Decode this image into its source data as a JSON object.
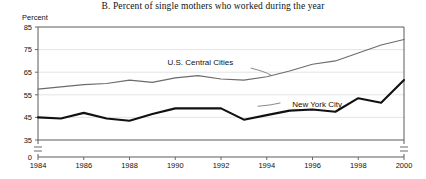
{
  "figure": {
    "title": "B. Percent of single mothers who worked during the year",
    "y_axis_label": "Percent"
  },
  "chart_data": {
    "type": "line",
    "title": "B. Percent of single mothers who worked during the year",
    "xlabel": "",
    "ylabel": "Percent",
    "x": [
      1984,
      1985,
      1986,
      1987,
      1988,
      1989,
      1990,
      1991,
      1992,
      1993,
      1994,
      1995,
      1996,
      1997,
      1998,
      1999,
      2000
    ],
    "xlim": [
      1984,
      2000
    ],
    "ylim": [
      35,
      85
    ],
    "y_break_to_zero": true,
    "x_tick_labels": [
      "1984",
      "1986",
      "1988",
      "1990",
      "1992",
      "1994",
      "1996",
      "1998",
      "2000"
    ],
    "y_tick_labels": [
      "0",
      "35",
      "45",
      "55",
      "65",
      "75",
      "85"
    ],
    "grid": "horizontal",
    "legend": "inline-annotations",
    "series": [
      {
        "name": "U.S. Central Cities",
        "color": "#6b6b6b",
        "style": "thin",
        "label_x": 1991.1,
        "label_y": 68.0,
        "values": [
          57.5,
          58.5,
          59.5,
          60.0,
          61.5,
          60.5,
          62.5,
          63.5,
          62.0,
          61.5,
          63.0,
          65.5,
          68.5,
          70.0,
          73.5,
          77.0,
          79.5
        ]
      },
      {
        "name": "New York City",
        "color": "#111111",
        "style": "thick",
        "label_x": 1996.2,
        "label_y": 49.5,
        "values": [
          45.0,
          44.5,
          47.0,
          44.5,
          43.5,
          46.5,
          49.0,
          49.0,
          49.0,
          44.0,
          46.0,
          48.0,
          48.5,
          47.5,
          53.5,
          51.5,
          61.5
        ]
      }
    ],
    "annotations": [
      {
        "text": "U.S. Central Cities",
        "x": 1991.1,
        "y": 68.0
      },
      {
        "text": "New York City",
        "x": 1996.2,
        "y": 49.5
      }
    ]
  }
}
